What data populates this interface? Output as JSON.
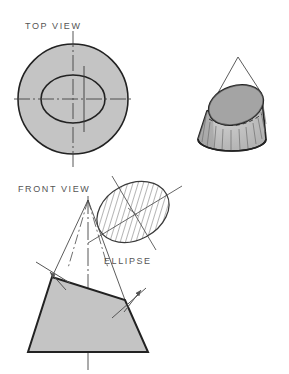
{
  "drawing": {
    "title_type": "orthographic-projection-conic-section",
    "labels": {
      "top_view": "TOP VIEW",
      "front_view": "FRONT VIEW",
      "ellipse": "ELLIPSE"
    },
    "colors": {
      "background": "#ffffff",
      "solid_fill": "#c4c4c4",
      "outline": "#222222",
      "thin_line": "#555555",
      "center_line": "#444444",
      "hatch_line": "#555555",
      "text": "#555555",
      "cone_shade_dark": "#9a9a9a",
      "cone_face_fill": "#b8b8b8"
    },
    "views": {
      "top_view": {
        "name": "TOP VIEW",
        "circle": {
          "cx": 73,
          "cy": 99,
          "r": 55
        },
        "ellipse": {
          "cx": 73,
          "cy": 99,
          "rx": 32,
          "ry": 24
        },
        "centerlines": {
          "horizontal": {
            "x1": 14,
            "y1": 99,
            "x2": 133,
            "y2": 99
          },
          "vertical": {
            "x1": 73,
            "y1": 31,
            "x2": 73,
            "y2": 168
          },
          "minor_axis": {
            "x1": 84,
            "y1": 66,
            "x2": 84,
            "y2": 132
          }
        }
      },
      "front_view": {
        "name": "FRONT VIEW",
        "apex": {
          "x": 88,
          "y": 200
        },
        "trapezoid": [
          {
            "x": 52,
            "y": 277
          },
          {
            "x": 125,
            "y": 300
          },
          {
            "x": 148,
            "y": 352
          },
          {
            "x": 28,
            "y": 352
          }
        ],
        "cut_line": {
          "x1": 52,
          "y1": 277,
          "x2": 125,
          "y2": 300
        },
        "cutting_plane_left": {
          "x1": 36,
          "y1": 262,
          "x2": 70,
          "y2": 283
        },
        "cutting_plane_right": {
          "x1": 112,
          "y1": 318,
          "x2": 146,
          "y2": 288
        },
        "centerline": {
          "x1": 88,
          "y1": 196,
          "x2": 88,
          "y2": 370
        }
      },
      "pictorial_cone": {
        "name": "cut-cone-pictorial",
        "apex": {
          "x": 238,
          "y": 57
        },
        "base_center": {
          "x": 232,
          "y": 139
        },
        "base_rx": 34,
        "base_ry": 12,
        "section_ellipse": {
          "cx": 236,
          "cy": 105,
          "rx": 28,
          "ry": 19,
          "rotate": -18
        },
        "element_lines": 11
      },
      "true_shape_ellipse": {
        "name": "ELLIPSE",
        "cx": 133,
        "cy": 212,
        "rx": 38,
        "ry": 28,
        "rotate": -28,
        "hatch_angle": 45,
        "hatch_spacing": 5,
        "major_axis": {
          "x1": 92,
          "y1": 238,
          "x2": 178,
          "y2": 190
        },
        "minor_axis": {
          "x1": 115,
          "y1": 180,
          "x2": 152,
          "y2": 245
        }
      }
    }
  }
}
